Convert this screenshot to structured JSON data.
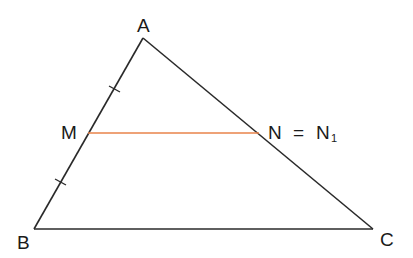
{
  "diagram": {
    "type": "triangle-midpoint",
    "points": {
      "A": {
        "label": "A",
        "x": 143,
        "y": 38
      },
      "B": {
        "label": "B",
        "x": 34,
        "y": 229
      },
      "C": {
        "label": "C",
        "x": 373,
        "y": 229
      },
      "M": {
        "label": "M",
        "x": 88,
        "y": 133
      },
      "N": {
        "label": "N",
        "x": 259,
        "y": 133
      }
    },
    "n_label": {
      "main": "N",
      "equals": "=",
      "n1": "N",
      "sub": "1"
    },
    "segments": [
      {
        "from": "A",
        "to": "B",
        "color": "#2a2a2a"
      },
      {
        "from": "A",
        "to": "C",
        "color": "#2a2a2a"
      },
      {
        "from": "B",
        "to": "C",
        "color": "#2a2a2a"
      },
      {
        "from": "M",
        "to": "N",
        "color": "#e8834a"
      }
    ],
    "tick_marks": [
      "AM",
      "MB"
    ],
    "colors": {
      "line": "#2a2a2a",
      "midline": "#e8834a"
    }
  }
}
